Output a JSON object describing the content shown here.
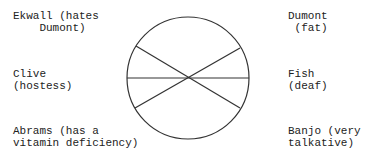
{
  "labels": {
    "ekwall": "Ekwall (hates\n    Dumont)",
    "clive": "Clive\n(hostess)",
    "abrams": "Abrams (has a\nvitamin deficiency)",
    "dumont": "Dumont\n (fat)",
    "fish": "Fish\n(deaf)",
    "banjo": "Banjo (very\ntalkative)"
  }
}
